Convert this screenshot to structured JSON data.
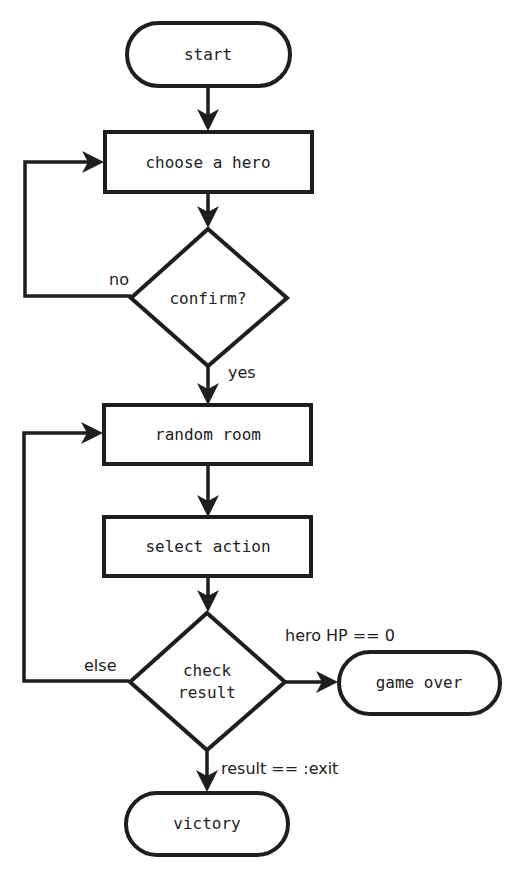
{
  "diagram": {
    "type": "flowchart",
    "colors": {
      "stroke": "#1e1e1e",
      "text": "#222222",
      "background": "#ffffff"
    },
    "nodes": {
      "start": {
        "label": "start",
        "shape": "terminator"
      },
      "choose_hero": {
        "label": "choose a hero",
        "shape": "process"
      },
      "confirm": {
        "label": "confirm?",
        "shape": "decision"
      },
      "random_room": {
        "label": "random room",
        "shape": "process"
      },
      "select_action": {
        "label": "select action",
        "shape": "process"
      },
      "check_result": {
        "label_line1": "check",
        "label_line2": "result",
        "shape": "decision"
      },
      "game_over": {
        "label": "game over",
        "shape": "terminator"
      },
      "victory": {
        "label": "victory",
        "shape": "terminator"
      }
    },
    "edges": {
      "start_to_choose": {
        "from": "start",
        "to": "choose_hero",
        "label": ""
      },
      "choose_to_confirm": {
        "from": "choose_hero",
        "to": "confirm",
        "label": ""
      },
      "confirm_no": {
        "from": "confirm",
        "to": "choose_hero",
        "label": "no"
      },
      "confirm_yes": {
        "from": "confirm",
        "to": "random_room",
        "label": "yes"
      },
      "room_to_action": {
        "from": "random_room",
        "to": "select_action",
        "label": ""
      },
      "action_to_check": {
        "from": "select_action",
        "to": "check_result",
        "label": ""
      },
      "check_else": {
        "from": "check_result",
        "to": "random_room",
        "label": "else"
      },
      "check_game_over": {
        "from": "check_result",
        "to": "game_over",
        "label": "hero HP == 0"
      },
      "check_victory": {
        "from": "check_result",
        "to": "victory",
        "label": "result == :exit"
      }
    }
  }
}
